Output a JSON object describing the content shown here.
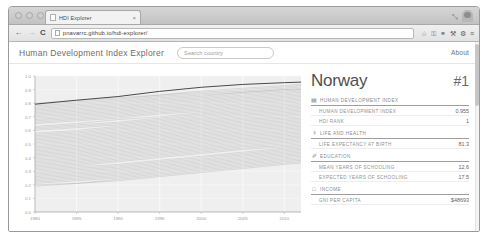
{
  "browser": {
    "tab": {
      "title": "HDI Explorer",
      "close_label": "×",
      "favicon": "page-icon"
    },
    "window_controls": {
      "close": "",
      "minimize": "",
      "zoom": "",
      "expand": "⤡"
    },
    "toolbar": {
      "back": "←",
      "forward": "→",
      "reload": "C",
      "url": "pnavarrc.github.io/hdi-explorer/",
      "star": "☆",
      "icons": [
        "key-icon",
        "binoculars-icon",
        "wrench-icon",
        "gear-icon",
        "menu-icon"
      ],
      "key": "⚿",
      "binoculars": "⚭",
      "wrench": "⚒",
      "gear": "⚙",
      "menu": "≡"
    }
  },
  "app": {
    "brand": "Human Development Index Explorer",
    "search": {
      "value": "",
      "placeholder": "Search country"
    },
    "about_label": "About"
  },
  "panel": {
    "country": "Norway",
    "rank_badge": "#1",
    "sections": [
      {
        "icon": "▤",
        "icon_name": "bar-chart-icon",
        "title": "Human Development Index",
        "rows": [
          {
            "label": "Human Development Index",
            "value": "0.955"
          },
          {
            "label": "HDI Rank",
            "value": "1"
          }
        ]
      },
      {
        "icon": "⚕",
        "icon_name": "health-icon",
        "title": "Life and Health",
        "rows": [
          {
            "label": "Life expectancy at birth",
            "value": "81.3"
          }
        ]
      },
      {
        "icon": "✐",
        "icon_name": "education-icon",
        "title": "Education",
        "rows": [
          {
            "label": "Mean years of schooling",
            "value": "12.6"
          },
          {
            "label": "Expected years of schooling",
            "value": "17.5"
          }
        ]
      },
      {
        "icon": "□",
        "icon_name": "income-icon",
        "title": "Income",
        "rows": [
          {
            "label": "GNI per capita",
            "value": "$48693"
          }
        ]
      }
    ]
  },
  "chart_data": {
    "type": "line",
    "title": "",
    "xlabel": "",
    "ylabel": "",
    "xlim": [
      1980,
      2012
    ],
    "ylim": [
      0.0,
      1.0
    ],
    "grid": true,
    "legend": false,
    "x_ticks": [
      1980,
      1985,
      1990,
      1995,
      2000,
      2005,
      2010
    ],
    "y_ticks": [
      0.0,
      0.1,
      0.2,
      0.3,
      0.4,
      0.5,
      0.6,
      0.7,
      0.8,
      0.9,
      1.0
    ],
    "x": [
      1980,
      1985,
      1990,
      1995,
      2000,
      2005,
      2010,
      2012
    ],
    "series_note": "Each faint grey line is one country's HDI trajectory; the dark highlighted line is the selected country (Norway).",
    "series": [
      {
        "name": "Norway",
        "highlight": true,
        "values": [
          0.793,
          0.822,
          0.849,
          0.887,
          0.917,
          0.938,
          0.951,
          0.955
        ]
      },
      {
        "name": "country-001",
        "values": [
          0.8,
          0.82,
          0.84,
          0.86,
          0.89,
          0.91,
          0.93,
          0.94
        ]
      },
      {
        "name": "country-002",
        "values": [
          0.79,
          0.81,
          0.83,
          0.86,
          0.88,
          0.9,
          0.92,
          0.93
        ]
      },
      {
        "name": "country-003",
        "values": [
          0.78,
          0.8,
          0.82,
          0.85,
          0.87,
          0.89,
          0.91,
          0.92
        ]
      },
      {
        "name": "country-004",
        "values": [
          0.77,
          0.79,
          0.81,
          0.84,
          0.86,
          0.88,
          0.9,
          0.91
        ]
      },
      {
        "name": "country-005",
        "values": [
          0.76,
          0.78,
          0.8,
          0.83,
          0.85,
          0.88,
          0.9,
          0.9
        ]
      },
      {
        "name": "country-006",
        "values": [
          0.75,
          0.77,
          0.79,
          0.82,
          0.84,
          0.87,
          0.89,
          0.9
        ]
      },
      {
        "name": "country-007",
        "values": [
          0.74,
          0.76,
          0.78,
          0.81,
          0.83,
          0.86,
          0.88,
          0.89
        ]
      },
      {
        "name": "country-008",
        "values": [
          0.73,
          0.75,
          0.77,
          0.8,
          0.82,
          0.85,
          0.87,
          0.88
        ]
      },
      {
        "name": "country-009",
        "values": [
          0.72,
          0.74,
          0.76,
          0.79,
          0.81,
          0.84,
          0.86,
          0.87
        ]
      },
      {
        "name": "country-010",
        "values": [
          0.71,
          0.73,
          0.75,
          0.78,
          0.8,
          0.83,
          0.85,
          0.86
        ]
      },
      {
        "name": "country-011",
        "values": [
          0.7,
          0.72,
          0.74,
          0.77,
          0.79,
          0.82,
          0.84,
          0.85
        ]
      },
      {
        "name": "country-012",
        "values": [
          0.69,
          0.71,
          0.73,
          0.76,
          0.78,
          0.81,
          0.83,
          0.84
        ]
      },
      {
        "name": "country-013",
        "values": [
          0.68,
          0.7,
          0.72,
          0.75,
          0.77,
          0.8,
          0.82,
          0.83
        ]
      },
      {
        "name": "country-014",
        "values": [
          0.67,
          0.69,
          0.71,
          0.74,
          0.76,
          0.79,
          0.81,
          0.82
        ]
      },
      {
        "name": "country-015",
        "values": [
          0.66,
          0.68,
          0.7,
          0.73,
          0.75,
          0.78,
          0.8,
          0.81
        ]
      },
      {
        "name": "country-016",
        "values": [
          0.65,
          0.67,
          0.69,
          0.72,
          0.74,
          0.77,
          0.79,
          0.8
        ]
      },
      {
        "name": "country-017",
        "values": [
          0.63,
          0.65,
          0.68,
          0.7,
          0.73,
          0.76,
          0.78,
          0.79
        ]
      },
      {
        "name": "country-018",
        "values": [
          0.62,
          0.64,
          0.66,
          0.69,
          0.72,
          0.75,
          0.77,
          0.78
        ]
      },
      {
        "name": "country-019",
        "values": [
          0.61,
          0.63,
          0.65,
          0.68,
          0.71,
          0.74,
          0.76,
          0.77
        ]
      },
      {
        "name": "country-020",
        "values": [
          0.6,
          0.62,
          0.64,
          0.67,
          0.7,
          0.73,
          0.75,
          0.76
        ]
      },
      {
        "name": "country-021",
        "values": [
          0.58,
          0.6,
          0.63,
          0.66,
          0.69,
          0.72,
          0.74,
          0.75
        ]
      },
      {
        "name": "country-022",
        "values": [
          0.57,
          0.59,
          0.62,
          0.65,
          0.68,
          0.71,
          0.73,
          0.74
        ]
      },
      {
        "name": "country-023",
        "values": [
          0.56,
          0.58,
          0.61,
          0.64,
          0.67,
          0.7,
          0.72,
          0.73
        ]
      },
      {
        "name": "country-024",
        "values": [
          0.55,
          0.57,
          0.6,
          0.63,
          0.66,
          0.69,
          0.71,
          0.72
        ]
      },
      {
        "name": "country-025",
        "values": [
          0.54,
          0.56,
          0.59,
          0.62,
          0.65,
          0.68,
          0.7,
          0.71
        ]
      },
      {
        "name": "country-026",
        "values": [
          0.53,
          0.55,
          0.58,
          0.61,
          0.64,
          0.67,
          0.69,
          0.7
        ]
      },
      {
        "name": "country-027",
        "values": [
          0.52,
          0.54,
          0.57,
          0.6,
          0.63,
          0.66,
          0.68,
          0.69
        ]
      },
      {
        "name": "country-028",
        "values": [
          0.51,
          0.53,
          0.56,
          0.59,
          0.62,
          0.65,
          0.67,
          0.68
        ]
      },
      {
        "name": "country-029",
        "values": [
          0.5,
          0.52,
          0.55,
          0.58,
          0.61,
          0.64,
          0.66,
          0.67
        ]
      },
      {
        "name": "country-030",
        "values": [
          0.49,
          0.51,
          0.54,
          0.57,
          0.6,
          0.63,
          0.65,
          0.66
        ]
      },
      {
        "name": "country-031",
        "values": [
          0.48,
          0.5,
          0.53,
          0.56,
          0.59,
          0.62,
          0.64,
          0.65
        ]
      },
      {
        "name": "country-032",
        "values": [
          0.47,
          0.49,
          0.52,
          0.55,
          0.58,
          0.61,
          0.63,
          0.64
        ]
      },
      {
        "name": "country-033",
        "values": [
          0.46,
          0.48,
          0.51,
          0.54,
          0.57,
          0.6,
          0.62,
          0.63
        ]
      },
      {
        "name": "country-034",
        "values": [
          0.45,
          0.47,
          0.5,
          0.53,
          0.56,
          0.59,
          0.61,
          0.62
        ]
      },
      {
        "name": "country-035",
        "values": [
          0.44,
          0.46,
          0.49,
          0.52,
          0.55,
          0.58,
          0.6,
          0.61
        ]
      },
      {
        "name": "country-036",
        "values": [
          0.43,
          0.45,
          0.48,
          0.51,
          0.54,
          0.57,
          0.59,
          0.6
        ]
      },
      {
        "name": "country-037",
        "values": [
          0.42,
          0.44,
          0.47,
          0.5,
          0.53,
          0.56,
          0.58,
          0.59
        ]
      },
      {
        "name": "country-038",
        "values": [
          0.41,
          0.43,
          0.46,
          0.49,
          0.52,
          0.55,
          0.57,
          0.58
        ]
      },
      {
        "name": "country-039",
        "values": [
          0.4,
          0.42,
          0.45,
          0.48,
          0.51,
          0.54,
          0.56,
          0.57
        ]
      },
      {
        "name": "country-040",
        "values": [
          0.39,
          0.41,
          0.44,
          0.47,
          0.5,
          0.53,
          0.55,
          0.56
        ]
      },
      {
        "name": "country-041",
        "values": [
          0.38,
          0.4,
          0.43,
          0.46,
          0.49,
          0.52,
          0.54,
          0.55
        ]
      },
      {
        "name": "country-042",
        "values": [
          0.37,
          0.39,
          0.42,
          0.45,
          0.48,
          0.51,
          0.53,
          0.54
        ]
      },
      {
        "name": "country-043",
        "values": [
          0.36,
          0.38,
          0.41,
          0.44,
          0.47,
          0.5,
          0.52,
          0.53
        ]
      },
      {
        "name": "country-044",
        "values": [
          0.35,
          0.37,
          0.4,
          0.43,
          0.46,
          0.49,
          0.51,
          0.52
        ]
      },
      {
        "name": "country-045",
        "values": [
          0.34,
          0.36,
          0.39,
          0.42,
          0.45,
          0.48,
          0.5,
          0.51
        ]
      },
      {
        "name": "country-046",
        "values": [
          0.33,
          0.35,
          0.38,
          0.41,
          0.44,
          0.47,
          0.49,
          0.5
        ]
      },
      {
        "name": "country-047",
        "values": [
          0.32,
          0.34,
          0.37,
          0.4,
          0.43,
          0.46,
          0.48,
          0.49
        ]
      },
      {
        "name": "country-048",
        "values": [
          0.31,
          0.33,
          0.35,
          0.38,
          0.41,
          0.44,
          0.47,
          0.48
        ]
      },
      {
        "name": "country-049",
        "values": [
          0.3,
          0.32,
          0.34,
          0.37,
          0.4,
          0.43,
          0.46,
          0.47
        ]
      },
      {
        "name": "country-050",
        "values": [
          0.29,
          0.31,
          0.33,
          0.36,
          0.39,
          0.42,
          0.45,
          0.46
        ]
      },
      {
        "name": "country-051",
        "values": [
          0.28,
          0.3,
          0.32,
          0.35,
          0.38,
          0.41,
          0.44,
          0.45
        ]
      },
      {
        "name": "country-052",
        "values": [
          0.27,
          0.29,
          0.31,
          0.34,
          0.37,
          0.4,
          0.43,
          0.44
        ]
      },
      {
        "name": "country-053",
        "values": [
          0.26,
          0.28,
          0.3,
          0.33,
          0.36,
          0.39,
          0.42,
          0.43
        ]
      },
      {
        "name": "country-054",
        "values": [
          0.25,
          0.27,
          0.29,
          0.32,
          0.35,
          0.38,
          0.41,
          0.42
        ]
      },
      {
        "name": "country-055",
        "values": [
          0.24,
          0.26,
          0.28,
          0.31,
          0.34,
          0.37,
          0.4,
          0.41
        ]
      },
      {
        "name": "country-056",
        "values": [
          0.23,
          0.25,
          0.27,
          0.3,
          0.33,
          0.36,
          0.39,
          0.4
        ]
      },
      {
        "name": "country-057",
        "values": [
          0.22,
          0.24,
          0.26,
          0.29,
          0.32,
          0.35,
          0.38,
          0.39
        ]
      },
      {
        "name": "country-058",
        "values": [
          0.21,
          0.23,
          0.25,
          0.28,
          0.31,
          0.34,
          0.37,
          0.38
        ]
      },
      {
        "name": "country-059",
        "values": [
          0.2,
          0.21,
          0.24,
          0.27,
          0.3,
          0.33,
          0.36,
          0.37
        ]
      },
      {
        "name": "country-060",
        "values": [
          0.19,
          0.21,
          0.23,
          0.26,
          0.29,
          0.32,
          0.35,
          0.36
        ]
      }
    ]
  }
}
